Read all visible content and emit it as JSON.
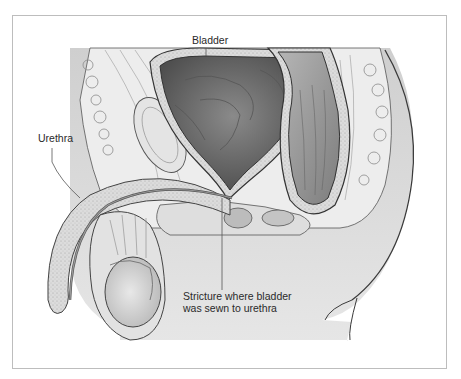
{
  "figure": {
    "labels": {
      "bladder": "Bladder",
      "urethra": "Urethra",
      "stricture_line1": "Stricture where bladder",
      "stricture_line2": "was sewn to urethra"
    }
  },
  "colors": {
    "frame_border": "#bdbdbd",
    "outline": "#3a3a3a",
    "skin": "#d9d9d9",
    "tissue_light": "#ececec",
    "tissue_mid": "#c4c4c4",
    "bladder_dark": "#6e6e6e",
    "rectum": "#9a9a9a",
    "label_text": "#2a2a2a"
  }
}
